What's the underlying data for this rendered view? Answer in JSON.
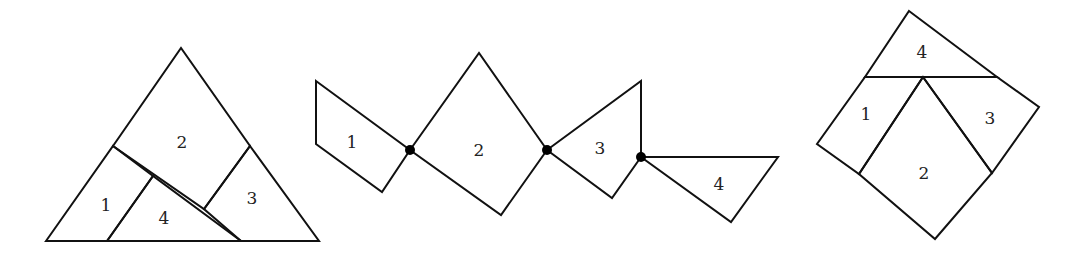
{
  "figures": [
    {
      "name": "equilateral-triangle-dissection",
      "pieces": [
        {
          "label": "1",
          "points": "46,241 113,146 153,176 107,241",
          "label_pos": [
            106,
            205
          ]
        },
        {
          "label": "2",
          "points": "113,146 181,48 250,146 204,209",
          "label_pos": [
            182,
            142
          ]
        },
        {
          "label": "3",
          "points": "250,146 319,241 241,241 204,209",
          "label_pos": [
            252,
            198
          ]
        },
        {
          "label": "4",
          "points": "107,241 153,176 241,241",
          "label_pos": [
            164,
            218
          ]
        }
      ]
    },
    {
      "name": "hinged-chain",
      "pieces": [
        {
          "label": "1",
          "points": "316,81 410,150 382,192 316,144",
          "label_pos": [
            352,
            142
          ]
        },
        {
          "label": "2",
          "points": "410,150 479,53 547,150 501,215",
          "label_pos": [
            479,
            150
          ]
        },
        {
          "label": "3",
          "points": "547,150 641,81 641,157 612,198",
          "label_pos": [
            600,
            148
          ]
        },
        {
          "label": "4",
          "points": "641,157 778,157 731,222",
          "label_pos": [
            719,
            184
          ]
        }
      ],
      "hinges": [
        [
          410,
          150
        ],
        [
          547,
          150
        ],
        [
          641,
          157
        ]
      ]
    },
    {
      "name": "square-dissection",
      "pieces": [
        {
          "label": "4",
          "points": "909,11 997,77 865,77",
          "label_pos": [
            922,
            52
          ]
        },
        {
          "label": "1",
          "points": "865,77 923,77 859,174 817,144",
          "label_pos": [
            866,
            114
          ]
        },
        {
          "label": "2",
          "points": "923,77 992,173 935,239 859,174",
          "label_pos": [
            924,
            173
          ]
        },
        {
          "label": "3",
          "points": "923,77 997,77 1039,107 992,173",
          "label_pos": [
            990,
            118
          ]
        }
      ]
    }
  ]
}
